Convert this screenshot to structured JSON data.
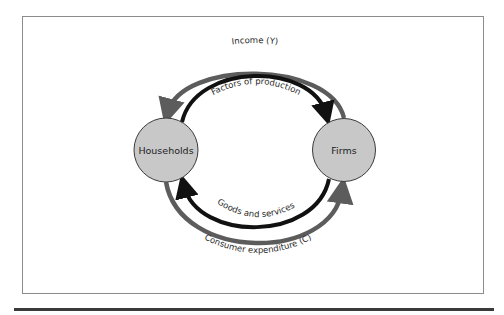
{
  "diagram": {
    "type": "circular-flow",
    "nodes": {
      "households": {
        "label": "Households"
      },
      "firms": {
        "label": "Firms"
      }
    },
    "flows": {
      "income": {
        "label": "Income (Y)",
        "from": "Firms",
        "to": "Households",
        "style": "outer-top",
        "color": "#5c5c5c"
      },
      "factors": {
        "label": "Factors of production",
        "from": "Households",
        "to": "Firms",
        "style": "inner-top",
        "color": "#111111"
      },
      "goods": {
        "label": "Goods and services",
        "from": "Firms",
        "to": "Households",
        "style": "inner-bottom",
        "color": "#111111"
      },
      "expenditure": {
        "label": "Consumer expenditure (C)",
        "from": "Households",
        "to": "Firms",
        "style": "outer-bottom",
        "color": "#5c5c5c"
      }
    },
    "colors": {
      "node_fill": "#c8c8c8",
      "node_stroke": "#3a3a3a",
      "frame": "#8c8c8c",
      "money_flow": "#5c5c5c",
      "real_flow": "#111111"
    }
  }
}
